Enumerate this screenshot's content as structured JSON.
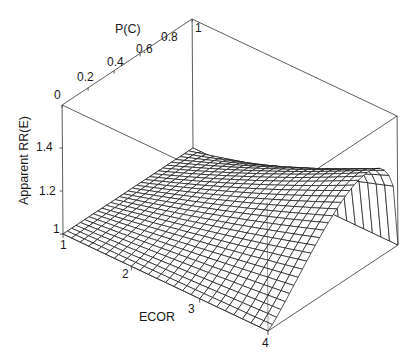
{
  "chart_data": {
    "type": "surface3d",
    "title": "",
    "xlabel": "ECOR",
    "ylabel": "P(C)",
    "zlabel": "Apparent RR(E)",
    "x_ticks": [
      "1",
      "2",
      "3",
      "4"
    ],
    "y_ticks": [
      "0",
      "0.2",
      "0.4",
      "0.6",
      "0.8",
      "1"
    ],
    "z_ticks": [
      "1",
      "1.2",
      "1.4"
    ],
    "x_range": [
      1,
      4
    ],
    "y_range": [
      0,
      1
    ],
    "z_range": [
      1,
      1.4
    ],
    "grid": false,
    "legend": "none",
    "surface_samples": {
      "ECOR": [
        1,
        2,
        3,
        4
      ],
      "P(C)": [
        0,
        0.2,
        0.4,
        0.6,
        0.8,
        1
      ],
      "RR": [
        [
          1.0,
          1.0,
          1.0,
          1.0,
          1.0,
          1.0
        ],
        [
          1.0,
          1.06,
          1.12,
          1.17,
          1.18,
          1.0
        ],
        [
          1.0,
          1.12,
          1.23,
          1.32,
          1.34,
          1.0
        ],
        [
          1.0,
          1.18,
          1.33,
          1.45,
          1.48,
          1.0
        ]
      ]
    }
  },
  "labels": {
    "x_axis_title": "ECOR",
    "y_axis_title": "P(C)",
    "z_axis_title": "Apparent RR(E)",
    "x_ticks": [
      "1",
      "2",
      "3",
      "4"
    ],
    "y_ticks": [
      "0",
      "0.2",
      "0.4",
      "0.6",
      "0.8",
      "1"
    ],
    "z_ticks": [
      "1",
      "1.2",
      "1.4"
    ]
  }
}
